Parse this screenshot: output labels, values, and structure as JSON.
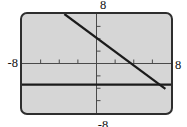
{
  "colors": {
    "page_bg": "#ffffff",
    "screen_bg": "#d6d6d6",
    "screen_border": "#2e2e2e",
    "axis": "#4a4a4a",
    "plot_line": "#1b1b1b",
    "label_text": "#111111"
  },
  "chart_data": {
    "type": "line",
    "title": "",
    "xlabel": "",
    "ylabel": "",
    "grid": false,
    "legend": false,
    "window": {
      "xmin": -8,
      "xmax": 8,
      "ymin": -8,
      "ymax": 8,
      "xscl": 2,
      "yscl": 2
    },
    "axis_edge_labels": {
      "top": "8",
      "left": "-8",
      "right": "8",
      "bottom": "-8"
    },
    "series": [
      {
        "name": "decreasing-line",
        "approx_equation": "y ≈ -x + 4",
        "points": [
          [
            -3.45,
            8
          ],
          [
            7.4,
            -4.1
          ]
        ]
      },
      {
        "name": "horizontal-line",
        "approx_equation": "y ≈ -3.4",
        "points": [
          [
            -8,
            -3.4
          ],
          [
            8,
            -3.4
          ]
        ]
      }
    ]
  }
}
